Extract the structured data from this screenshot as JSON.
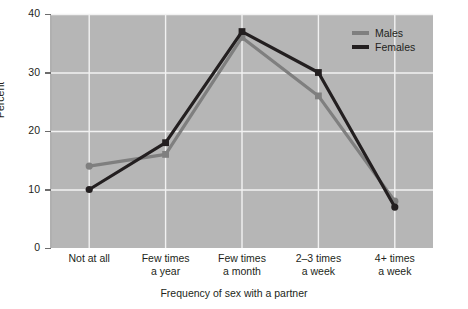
{
  "chart_data": {
    "type": "line",
    "title": "",
    "xlabel": "Frequency of sex with a partner",
    "ylabel": "Percent",
    "categories": [
      "Not at all",
      "Few times a year",
      "Few times a month",
      "2–3 times a week",
      "4+ times a week"
    ],
    "category_lines": [
      [
        "Not at all",
        ""
      ],
      [
        "Few times",
        "a year"
      ],
      [
        "Few times",
        "a month"
      ],
      [
        "2–3 times",
        "a week"
      ],
      [
        "4+ times",
        "a week"
      ]
    ],
    "series": [
      {
        "name": "Males",
        "color": "#7f7f7f",
        "values": [
          14,
          16,
          36,
          26,
          8
        ]
      },
      {
        "name": "Females",
        "color": "#231f20",
        "values": [
          10,
          18,
          37,
          30,
          7
        ]
      }
    ],
    "ylim": [
      0,
      40
    ],
    "yticks": [
      0,
      10,
      20,
      30,
      40
    ],
    "ytick_labels": [
      "0",
      "10",
      "20",
      "30",
      "40"
    ],
    "grid": true,
    "grid_color": "#f2f2f2",
    "plot_background": "#b6b6b6",
    "legend_position": "top-right",
    "legend": [
      "Males",
      "Females"
    ]
  }
}
